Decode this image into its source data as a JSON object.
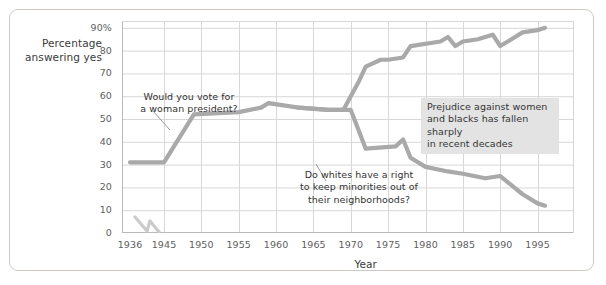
{
  "figure": {
    "background_color": "#ffffff",
    "frame_color": "#cfcac4"
  },
  "chart_data": {
    "type": "line",
    "title": "",
    "xlabel": "Year",
    "ylabel": "Percentage answering yes",
    "ylabel_line1": "Percentage",
    "ylabel_line2": "answering yes",
    "xlim": [
      1936,
      1998
    ],
    "ylim": [
      0,
      93
    ],
    "grid": true,
    "legend_position": "none",
    "axis_break": {
      "present": true,
      "between": [
        1936,
        1945
      ],
      "axis": "x"
    },
    "ytick_labels": [
      "0",
      "10",
      "20",
      "30",
      "40",
      "50",
      "60",
      "70",
      "80",
      "90%"
    ],
    "ytick_values": [
      0,
      10,
      20,
      30,
      40,
      50,
      60,
      70,
      80,
      90
    ],
    "xtick_labels": [
      "1936",
      "1945",
      "1950",
      "1955",
      "1960",
      "1965",
      "1970",
      "1975",
      "1980",
      "1985",
      "1990",
      "1995"
    ],
    "xtick_values": [
      1936,
      1945,
      1950,
      1955,
      1960,
      1965,
      1970,
      1975,
      1980,
      1985,
      1990,
      1995
    ],
    "line_color": "#a9a9a9",
    "series": [
      {
        "name": "Would you vote for a woman president?",
        "x": [
          1936,
          1945,
          1949,
          1955,
          1958,
          1959,
          1963,
          1967,
          1969,
          1971,
          1972,
          1974,
          1975,
          1977,
          1978,
          1982,
          1983,
          1984,
          1985,
          1987,
          1988,
          1989,
          1990,
          1993,
          1995,
          1996
        ],
        "values": [
          31,
          31,
          52,
          53,
          55,
          57,
          55,
          54,
          54,
          66,
          73,
          76,
          76,
          77,
          82,
          84,
          86,
          82,
          84,
          85,
          86,
          87,
          82,
          88,
          89,
          90
        ]
      },
      {
        "name": "Do whites have a right to keep minorities out of their neighborhoods?",
        "x": [
          1963,
          1967,
          1969,
          1970,
          1972,
          1976,
          1977,
          1978,
          1980,
          1983,
          1985,
          1988,
          1990,
          1993,
          1995,
          1996
        ],
        "values": [
          55,
          54,
          54,
          54,
          37,
          38,
          41,
          33,
          29,
          27,
          26,
          24,
          25,
          17,
          13,
          12
        ]
      }
    ],
    "annotations": [
      {
        "id": "annotation-woman-president",
        "text": "Would you vote for\na woman president?",
        "boxed": false,
        "leader_line": true
      },
      {
        "id": "annotation-whites-neighborhoods",
        "text": "Do whites have a right\nto keep minorities out of\ntheir neighborhoods?",
        "boxed": false,
        "leader_line": true
      },
      {
        "id": "annotation-prejudice-summary",
        "text": "Prejudice against women\nand blacks has fallen sharply\nin recent decades",
        "boxed": true,
        "box_color": "#e3e3e3",
        "leader_line": false
      }
    ]
  }
}
